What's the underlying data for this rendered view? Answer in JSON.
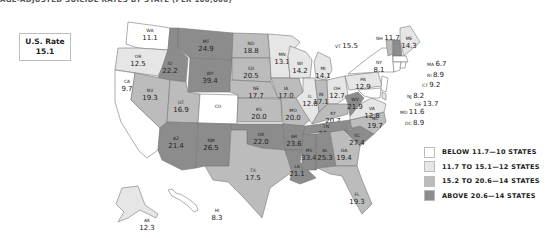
{
  "title": "AGE-ADJUSTED SUICIDE RATES BY STATE (PER 100,000)",
  "us_rate": {
    "label": "U.S. Rate",
    "value": "15.1"
  },
  "colors": {
    "below": "#ffffff",
    "low": "#e6e6e6",
    "mid": "#bcbcbc",
    "high": "#8c8c8c",
    "stroke": "#777777"
  },
  "legend": [
    {
      "label": "BELOW 11.7—10 STATES",
      "class": "below",
      "color": "#ffffff"
    },
    {
      "label": "11.7 TO 15.1—12 STATES",
      "class": "low",
      "color": "#e6e6e6"
    },
    {
      "label": "15.2 TO 20.6—14 STATES",
      "class": "mid",
      "color": "#bcbcbc"
    },
    {
      "label": "ABOVE 20.6—14 STATES",
      "class": "high",
      "color": "#8c8c8c"
    }
  ],
  "chart_data": {
    "type": "choropleth",
    "reference": {
      "label": "U.S. Rate",
      "value": 15.1
    },
    "bins": [
      {
        "label": "BELOW 11.7",
        "count": 10
      },
      {
        "label": "11.7 TO 15.1",
        "count": 12
      },
      {
        "label": "15.2 TO 20.6",
        "count": 14
      },
      {
        "label": "ABOVE 20.6",
        "count": 14
      }
    ],
    "states": {
      "WA": 11.1,
      "OR": 12.5,
      "CA": 9.7,
      "ID": 22.2,
      "NV": 19.3,
      "UT": 16.9,
      "AZ": 21.4,
      "MT": 24.9,
      "WY": 39.4,
      "CO": null,
      "NM": 26.5,
      "ND": 18.8,
      "SD": 20.5,
      "NE": 17.7,
      "KS": 20.0,
      "OK": 22.0,
      "TX": 17.5,
      "MN": 13.1,
      "IA": 17.0,
      "MO": 20.0,
      "AR": 23.6,
      "LA": 21.1,
      "WI": 14.2,
      "IL": 12.0,
      "MI": 14.1,
      "IN": 17.1,
      "OH": 12.7,
      "KY": 20.7,
      "TN": 23.4,
      "MS": 33.4,
      "AL": 25.3,
      "GA": 19.4,
      "FL": 19.3,
      "SC": 27.4,
      "NC": 19.7,
      "VA": 12.8,
      "WV": 21.9,
      "PA": 12.9,
      "NY": 8.1,
      "VT": 15.5,
      "NH": 11.7,
      "ME": 14.3,
      "MA": 6.7,
      "RI": 8.9,
      "CT": 9.2,
      "NJ": 8.2,
      "DE": 13.7,
      "MD": 11.6,
      "DC": 8.9,
      "AK": 12.3,
      "HI": 8.3
    }
  },
  "map": {
    "states": [
      {
        "id": "WA",
        "label": "WA",
        "value": "11.1",
        "cls": "below",
        "pts": "128,22 158,26 170,28 168,50 138,48 126,44",
        "lx": 150,
        "ly": 32
      },
      {
        "id": "OR",
        "label": "OR",
        "value": "12.5",
        "cls": "low",
        "pts": "118,48 138,48 168,50 162,68 158,76 115,70",
        "lx": 138,
        "ly": 58
      },
      {
        "id": "CA",
        "label": "CA",
        "value": "9.7",
        "cls": "below",
        "pts": "115,70 135,73 131,100 160,128 158,150 147,158 139,151 121,122 115,102",
        "lx": 127,
        "ly": 83
      },
      {
        "id": "ID",
        "label": "ID",
        "value": "22.2",
        "cls": "high",
        "pts": "170,28 178,28 178,48 188,58 186,82 158,78 162,68 168,50",
        "lx": 170,
        "ly": 65
      },
      {
        "id": "NV",
        "label": "NV",
        "value": "19.3",
        "cls": "mid",
        "pts": "135,73 170,80 167,122 160,128 131,100",
        "lx": 150,
        "ly": 92
      },
      {
        "id": "UT",
        "label": "UT",
        "value": "16.9",
        "cls": "mid",
        "pts": "170,80 186,82 188,92 200,94 198,123 167,122",
        "lx": 181,
        "ly": 104
      },
      {
        "id": "AZ",
        "label": "AZ",
        "value": "21.4",
        "cls": "high",
        "pts": "167,122 198,123 196,168 182,170 162,160 158,150 160,128",
        "lx": 176,
        "ly": 140
      },
      {
        "id": "MT",
        "label": "MT",
        "value": "24.9",
        "cls": "high",
        "pts": "178,28 233,33 232,60 190,58 178,48",
        "lx": 206,
        "ly": 43
      },
      {
        "id": "WY",
        "label": "WY",
        "value": "39.4",
        "cls": "high",
        "pts": "190,58 232,60 230,92 188,92",
        "lx": 210,
        "ly": 75
      },
      {
        "id": "CO",
        "label": "CO",
        "value": "",
        "cls": "below",
        "pts": "200,94 238,95 237,124 198,123",
        "lx": 218,
        "ly": 108
      },
      {
        "id": "NM",
        "label": "NM",
        "value": "26.5",
        "cls": "high",
        "pts": "198,123 231,124 229,166 205,166 196,168",
        "lx": 211,
        "ly": 142
      },
      {
        "id": "ND",
        "label": "ND",
        "value": "18.8",
        "cls": "mid",
        "pts": "233,33 268,34 270,58 232,58",
        "lx": 251,
        "ly": 45
      },
      {
        "id": "SD",
        "label": "SD",
        "value": "20.5",
        "cls": "mid",
        "pts": "232,58 270,58 271,82 232,80",
        "lx": 251,
        "ly": 70
      },
      {
        "id": "NE",
        "label": "NE",
        "value": "17.7",
        "cls": "mid",
        "pts": "230,80 271,82 278,98 238,98 238,95 230,92",
        "lx": 256,
        "ly": 90
      },
      {
        "id": "KS",
        "label": "KS",
        "value": "20.0",
        "cls": "mid",
        "pts": "238,98 281,99 282,122 237,122",
        "lx": 259,
        "ly": 111
      },
      {
        "id": "OK",
        "label": "OK",
        "value": "22.0",
        "cls": "high",
        "pts": "231,124 283,124 285,150 262,148 247,144 247,130 231,130",
        "lx": 261,
        "ly": 136
      },
      {
        "id": "TX",
        "label": "TX",
        "value": "17.5",
        "cls": "mid",
        "pts": "231,130 247,130 247,144 262,148 285,150 292,172 270,188 262,218 244,198 228,182 213,180 205,166 229,166",
        "lx": 253,
        "ly": 172
      },
      {
        "id": "MN",
        "label": "MN",
        "value": "13.1",
        "cls": "low",
        "pts": "268,34 292,36 300,42 288,56 290,78 271,78 270,58",
        "lx": 282,
        "ly": 56
      },
      {
        "id": "IA",
        "label": "IA",
        "value": "17.0",
        "cls": "mid",
        "pts": "271,78 299,78 303,92 296,98 278,98",
        "lx": 286,
        "ly": 90
      },
      {
        "id": "MO",
        "label": "MO",
        "value": "20.0",
        "cls": "mid",
        "pts": "278,98 296,98 310,120 303,126 283,124 281,99",
        "lx": 293,
        "ly": 112
      },
      {
        "id": "AR",
        "label": "AR",
        "value": "23.6",
        "cls": "high",
        "pts": "283,124 305,126 302,150 285,150",
        "lx": 294,
        "ly": 138
      },
      {
        "id": "LA",
        "label": "LA",
        "value": "21.1",
        "cls": "high",
        "pts": "285,150 302,150 300,162 316,178 300,184 290,180 292,172",
        "lx": 297,
        "ly": 168
      },
      {
        "id": "WI",
        "label": "WI",
        "value": "14.2",
        "cls": "low",
        "pts": "290,46 306,52 312,60 310,78 299,78 290,78 288,56",
        "lx": 300,
        "ly": 65
      },
      {
        "id": "IL",
        "label": "IL",
        "value": "12.0",
        "cls": "low",
        "pts": "303,78 315,78 319,112 312,124 303,110 296,98 303,92",
        "lx": 310,
        "ly": 98
      },
      {
        "id": "MI",
        "label": "MI",
        "value": "14.1",
        "cls": "low",
        "pts": "318,52 330,58 332,70 326,80 316,78 314,62",
        "lx": 323,
        "ly": 70
      },
      {
        "id": "IN",
        "label": "IN",
        "value": "17.1",
        "cls": "mid",
        "pts": "315,80 327,80 328,104 319,112",
        "lx": 321,
        "ly": 96
      },
      {
        "id": "OH",
        "label": "OH",
        "value": "12.7",
        "cls": "low",
        "pts": "327,80 345,76 348,96 337,104 328,104",
        "lx": 337,
        "ly": 90
      },
      {
        "id": "KY",
        "label": "KY",
        "value": "20.7",
        "cls": "mid",
        "pts": "319,112 328,104 337,104 348,104 348,114 312,124",
        "lx": 333,
        "ly": 115
      },
      {
        "id": "TN",
        "label": "TN",
        "value": "23.4",
        "cls": "high",
        "pts": "305,126 350,120 358,118 352,130 303,134",
        "lx": 326,
        "ly": 128
      },
      {
        "id": "MS",
        "label": "MS",
        "value": "33.4",
        "cls": "high",
        "pts": "303,134 316,134 316,170 302,170 302,150",
        "lx": 309,
        "ly": 152
      },
      {
        "id": "AL",
        "label": "AL",
        "value": "25.3",
        "cls": "high",
        "pts": "316,134 330,132 336,166 318,168 316,170",
        "lx": 325,
        "ly": 152
      },
      {
        "id": "GA",
        "label": "GA",
        "value": "19.4",
        "cls": "mid",
        "pts": "330,132 344,130 360,146 357,166 336,166",
        "lx": 344,
        "ly": 152
      },
      {
        "id": "FL",
        "label": "FL",
        "value": "19.3",
        "cls": "mid",
        "pts": "318,168 336,166 357,166 362,180 372,204 362,214 354,200 342,176 330,174",
        "lx": 357,
        "ly": 196
      },
      {
        "id": "SC",
        "label": "SC",
        "value": "27.4",
        "cls": "high",
        "pts": "344,130 360,126 374,134 360,146",
        "lx": 357,
        "ly": 137
      },
      {
        "id": "NC",
        "label": "NC",
        "value": "19.7",
        "cls": "mid",
        "pts": "350,120 384,112 386,122 374,134 360,126 344,130 352,130",
        "lx": 375,
        "ly": 120
      },
      {
        "id": "VA",
        "label": "VA",
        "value": "12.8",
        "cls": "low",
        "pts": "350,116 360,104 372,98 386,104 384,112 350,120",
        "lx": 372,
        "ly": 110
      },
      {
        "id": "WV",
        "label": "WV",
        "value": "21.9",
        "cls": "high",
        "pts": "345,96 358,92 364,98 360,104 350,116 348,104",
        "lx": 355,
        "ly": 101
      },
      {
        "id": "PA",
        "label": "PA",
        "value": "12.9",
        "cls": "low",
        "pts": "345,76 378,72 382,86 349,90",
        "lx": 363,
        "ly": 81
      },
      {
        "id": "NY",
        "label": "NY",
        "value": "8.1",
        "cls": "below",
        "pts": "348,74 368,58 382,48 392,48 394,72 378,72",
        "lx": 379,
        "ly": 64
      },
      {
        "id": "VT",
        "label": "VT",
        "value": "",
        "cls": "mid",
        "pts": "386,40 393,40 393,54 388,56",
        "lx": 0,
        "ly": 0
      },
      {
        "id": "NH",
        "label": "NH",
        "value": "",
        "cls": "high",
        "pts": "393,40 400,40 402,56 393,56",
        "lx": 0,
        "ly": 0
      },
      {
        "id": "ME",
        "label": "ME",
        "value": "14.3",
        "cls": "low",
        "pts": "400,28 410,26 420,42 404,56 400,40",
        "lx": 409,
        "ly": 40
      },
      {
        "id": "MA",
        "label": "MA",
        "value": "",
        "cls": "below",
        "pts": "393,56 406,56 408,62 393,62",
        "lx": 0,
        "ly": 0
      },
      {
        "id": "CT",
        "label": "CT",
        "value": "",
        "cls": "below",
        "pts": "393,62 401,62 400,70 394,72",
        "lx": 0,
        "ly": 0
      },
      {
        "id": "RI",
        "label": "RI",
        "value": "",
        "cls": "below",
        "pts": "401,62 406,62 405,68 400,68",
        "lx": 0,
        "ly": 0
      },
      {
        "id": "NJ",
        "label": "NJ",
        "value": "",
        "cls": "below",
        "pts": "382,76 388,78 386,92 381,90",
        "lx": 0,
        "ly": 0
      },
      {
        "id": "DE",
        "label": "DE",
        "value": "",
        "cls": "low",
        "pts": "382,92 386,94 386,100 382,98",
        "lx": 0,
        "ly": 0
      },
      {
        "id": "MD",
        "label": "MD",
        "value": "",
        "cls": "below",
        "pts": "358,90 381,88 380,98 372,98 364,96",
        "lx": 0,
        "ly": 0
      },
      {
        "id": "AK",
        "label": "AK",
        "value": "12.3",
        "cls": "low",
        "pts": "122,188 138,186 145,205 158,214 156,218 140,210 128,218 118,222 124,212 116,204",
        "lx": 147,
        "ly": 222
      },
      {
        "id": "HI",
        "label": "HI",
        "value": "8.3",
        "cls": "below",
        "pts": "168,190 172,189 176,193 182,195 190,200 196,205 198,210 194,212 188,206 180,200 172,196",
        "lx": 217,
        "ly": 212
      }
    ],
    "callouts": [
      {
        "abbr": "VT",
        "value": "15.5",
        "x": 335,
        "y": 48
      },
      {
        "abbr": "NH",
        "value": "11.7",
        "x": 376,
        "y": 40
      },
      {
        "abbr": "MA",
        "value": "6.7",
        "x": 427,
        "y": 66
      },
      {
        "abbr": "RI",
        "value": "8.9",
        "x": 427,
        "y": 77
      },
      {
        "abbr": "CT",
        "value": "9.2",
        "x": 422,
        "y": 87
      },
      {
        "abbr": "NJ",
        "value": "8.2",
        "x": 407,
        "y": 98
      },
      {
        "abbr": "DE",
        "value": "13.7",
        "x": 415,
        "y": 106
      },
      {
        "abbr": "MD",
        "value": "11.6",
        "x": 400,
        "y": 114
      },
      {
        "abbr": "DC",
        "value": "8.9",
        "x": 405,
        "y": 125
      }
    ]
  }
}
